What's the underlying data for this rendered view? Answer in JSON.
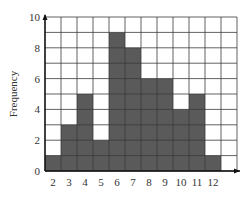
{
  "chart_data": {
    "type": "bar",
    "title": "",
    "xlabel": "",
    "ylabel": "Frequency",
    "categories": [
      "2",
      "3",
      "4",
      "5",
      "6",
      "7",
      "8",
      "9",
      "10",
      "11",
      "12"
    ],
    "values": [
      1,
      3,
      5,
      2,
      9,
      8,
      6,
      6,
      4,
      5,
      1
    ],
    "ylim": [
      0,
      10
    ],
    "yticks": [
      0,
      2,
      4,
      6,
      8,
      10
    ],
    "grid": true,
    "grid_columns": 12,
    "grid_rows": 10,
    "legend": null,
    "colors": {
      "bar": "#5a5a5a",
      "grid": "#3a3a3a",
      "background": "#ffffff"
    }
  }
}
